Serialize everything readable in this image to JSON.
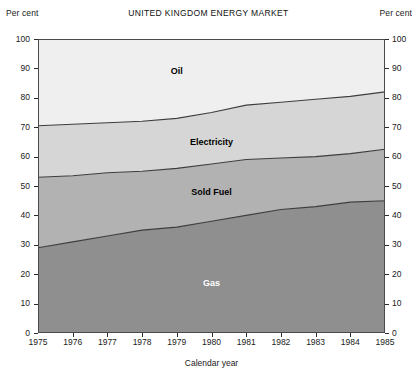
{
  "figure": {
    "title": "UNITED KINGDOM ENERGY MARKET",
    "unit_label_left": "Per cent",
    "unit_label_right": "Per cent",
    "x_axis_title": "Calendar year"
  },
  "chart_data": {
    "type": "area",
    "title": "UNITED KINGDOM ENERGY MARKET",
    "subtitle": "",
    "xlabel": "Calendar year",
    "ylabel": "Per cent",
    "xlim": [
      1975,
      1985
    ],
    "ylim": [
      0,
      100
    ],
    "stacked": true,
    "grid": false,
    "legend_position": "inline-band-labels",
    "x": [
      1975,
      1976,
      1977,
      1978,
      1979,
      1980,
      1981,
      1982,
      1983,
      1984,
      1985
    ],
    "xticklabels": [
      "1975",
      "1976",
      "1977",
      "1978",
      "1979",
      "1980",
      "1981",
      "1982",
      "1983",
      "1984",
      "1985"
    ],
    "yticks": [
      0,
      10,
      20,
      30,
      40,
      50,
      60,
      70,
      80,
      90,
      100
    ],
    "yticklabels": [
      "0",
      "10",
      "20",
      "30",
      "40",
      "50",
      "60",
      "70",
      "80",
      "90",
      "100"
    ],
    "series": [
      {
        "name": "Gas",
        "color": "#8f8f8f",
        "label_x": 1980,
        "label_y": 17,
        "label_color": "#ffffff",
        "values": [
          29,
          31,
          33,
          35,
          36,
          38,
          40,
          42,
          43,
          44.5,
          45
        ],
        "cumulative_top": [
          29,
          31,
          33,
          35,
          36,
          38,
          40,
          42,
          43,
          44.5,
          45
        ]
      },
      {
        "name": "Sold Fuel",
        "color": "#b2b2b2",
        "label_x": 1980,
        "label_y": 48,
        "label_color": "#000000",
        "values": [
          24,
          22.5,
          21.5,
          20,
          20,
          19.5,
          19,
          17.5,
          17,
          16.5,
          17.5
        ],
        "cumulative_top": [
          53,
          53.5,
          54.5,
          55,
          56,
          57.5,
          59,
          59.5,
          60,
          61,
          62.5
        ]
      },
      {
        "name": "Electricity",
        "color": "#d6d6d6",
        "label_x": 1980,
        "label_y": 65,
        "label_color": "#000000",
        "values": [
          17.5,
          17.5,
          17,
          17,
          17,
          17.5,
          18.5,
          19,
          19.5,
          19.5,
          19.5
        ],
        "cumulative_top": [
          70.5,
          71,
          71.5,
          72,
          73,
          75,
          77.5,
          78.5,
          79.5,
          80.5,
          82
        ]
      },
      {
        "name": "Oil",
        "color": "#efefef",
        "label_x": 1979,
        "label_y": 89,
        "label_color": "#000000",
        "values": [
          29.5,
          29,
          28.5,
          28,
          27,
          25,
          22.5,
          21.5,
          20.5,
          19.5,
          18
        ],
        "cumulative_top": [
          100,
          100,
          100,
          100,
          100,
          100,
          100,
          100,
          100,
          100,
          100
        ]
      }
    ]
  }
}
